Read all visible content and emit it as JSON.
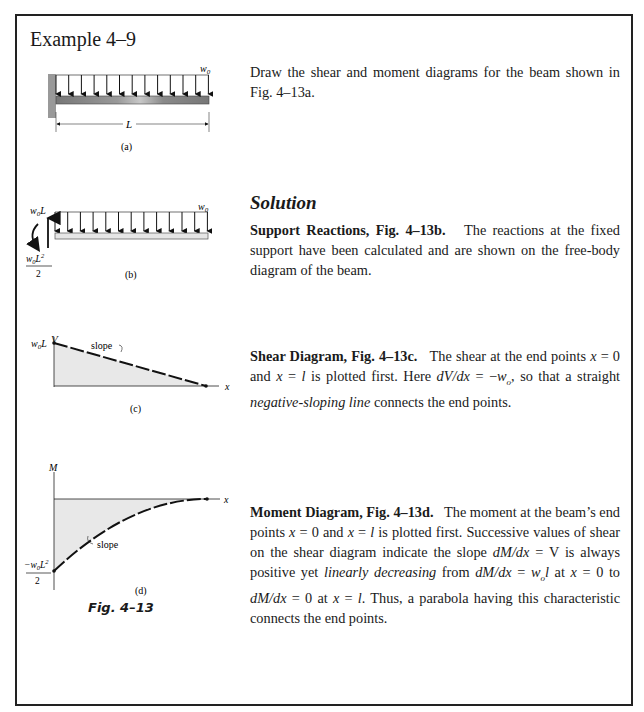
{
  "header": {
    "title": "Example 4–9"
  },
  "problem": {
    "text": "Draw the shear and moment diagrams for the beam shown in Fig. 4–13a."
  },
  "solution": {
    "heading": "Solution",
    "sections": [
      {
        "heading": "Support Reactions, Fig. 4–13b.",
        "body": "The reactions at the fixed support have been calculated and are shown on the free-body diagram of the beam."
      },
      {
        "heading": "Shear Diagram, Fig. 4–13c.",
        "body_parts": [
          {
            "t": "The shear at the end points "
          },
          {
            "t": "x",
            "i": true
          },
          {
            "t": " = 0 and "
          },
          {
            "t": "x",
            "i": true
          },
          {
            "t": " = "
          },
          {
            "t": "l",
            "i": true
          },
          {
            "t": " is plotted first. Here "
          },
          {
            "t": "dV/dx",
            "i": true
          },
          {
            "t": " = −"
          },
          {
            "t": "w",
            "i": true
          },
          {
            "t": "o",
            "sub": true,
            "i": true
          },
          {
            "t": ", so that a straight "
          },
          {
            "t": "negative-sloping line",
            "i": true
          },
          {
            "t": " connects the end points."
          }
        ]
      },
      {
        "heading": "Moment Diagram, Fig. 4–13d.",
        "body_parts": [
          {
            "t": "The moment at the beam’s end points "
          },
          {
            "t": "x",
            "i": true
          },
          {
            "t": " = 0 and "
          },
          {
            "t": "x",
            "i": true
          },
          {
            "t": " = "
          },
          {
            "t": "l",
            "i": true
          },
          {
            "t": " is plotted first. Successive values of shear on the shear diagram indicate the slope "
          },
          {
            "t": "dM/dx",
            "i": true
          },
          {
            "t": " = V is always positive yet "
          },
          {
            "t": "linearly decreasing",
            "i": true
          },
          {
            "t": " from "
          },
          {
            "t": "dM/dx",
            "i": true
          },
          {
            "t": " = "
          },
          {
            "t": "w",
            "i": true
          },
          {
            "t": "o",
            "sub": true,
            "i": true
          },
          {
            "t": "l",
            "i": true
          },
          {
            "t": " at "
          },
          {
            "t": "x",
            "i": true
          },
          {
            "t": " = 0 to "
          },
          {
            "t": "dM/dx",
            "i": true
          },
          {
            "t": " = 0 at "
          },
          {
            "t": "x",
            "i": true
          },
          {
            "t": " = "
          },
          {
            "t": "l",
            "i": true
          },
          {
            "t": ". Thus, a parabola having this characteristic connects the end points."
          }
        ]
      }
    ]
  },
  "figures": {
    "a": {
      "load_label": "w0",
      "length_label": "L",
      "caption": "(a)"
    },
    "b": {
      "force_label": "w0L",
      "moment_label_num": "w0L²",
      "moment_label_den": "2",
      "load_label": "w0",
      "caption": "(b)"
    },
    "c": {
      "y_axis": "V",
      "x_axis": "x",
      "start_value": "w0L",
      "slope_label": "slope",
      "caption": "(c)"
    },
    "d": {
      "y_axis": "M",
      "x_axis": "x",
      "start_value_num": "−w0L²",
      "start_value_den": "2",
      "slope_label": "slope",
      "caption": "(d)"
    },
    "figure_caption": "Fig. 4–13"
  }
}
